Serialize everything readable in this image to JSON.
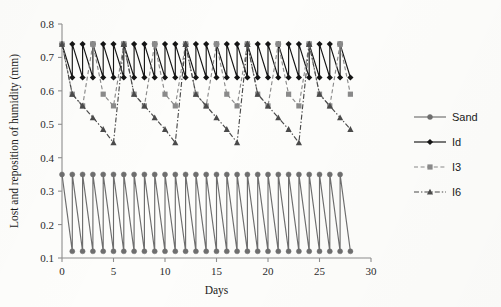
{
  "chart_data": {
    "type": "line",
    "title": "",
    "xlabel": "Days",
    "ylabel": "Lost and reposition of humidity (mm)",
    "xlim": [
      0,
      30
    ],
    "ylim": [
      0.1,
      0.8
    ],
    "xticks": [
      "0",
      "5",
      "10",
      "15",
      "20",
      "25",
      "30"
    ],
    "xtick_values": [
      0,
      5,
      10,
      15,
      20,
      25,
      30
    ],
    "yticks": [
      "0.1",
      "0.2",
      "0.3",
      "0.4",
      "0.5",
      "0.6",
      "0.7",
      "0.8"
    ],
    "ytick_values": [
      0.1,
      0.2,
      0.3,
      0.4,
      0.5,
      0.6,
      0.7,
      0.8
    ],
    "grid": false,
    "legend_position": "right",
    "series": [
      {
        "name": "Sand",
        "marker": "circle",
        "line_style": "solid",
        "color": "#6e6e6e",
        "marker_color": "#6e6e6e",
        "cycle_days": 1,
        "peak": 0.35,
        "trough": 0.12,
        "x": [
          0,
          1,
          1,
          2,
          2,
          3,
          3,
          4,
          4,
          5,
          5,
          6,
          6,
          7,
          7,
          8,
          8,
          9,
          9,
          10,
          10,
          11,
          11,
          12,
          12,
          13,
          13,
          14,
          14,
          15,
          15,
          16,
          16,
          17,
          17,
          18,
          18,
          19,
          19,
          20,
          20,
          21,
          21,
          22,
          22,
          23,
          23,
          24,
          24,
          25,
          25,
          26,
          26,
          27,
          27,
          28
        ],
        "y": [
          0.35,
          0.12,
          0.35,
          0.12,
          0.35,
          0.12,
          0.35,
          0.12,
          0.35,
          0.12,
          0.35,
          0.12,
          0.35,
          0.12,
          0.35,
          0.12,
          0.35,
          0.12,
          0.35,
          0.12,
          0.35,
          0.12,
          0.35,
          0.12,
          0.35,
          0.12,
          0.35,
          0.12,
          0.35,
          0.12,
          0.35,
          0.12,
          0.35,
          0.12,
          0.35,
          0.12,
          0.35,
          0.12,
          0.35,
          0.12,
          0.35,
          0.12,
          0.35,
          0.12,
          0.35,
          0.12,
          0.35,
          0.12,
          0.35,
          0.12,
          0.35,
          0.12,
          0.35,
          0.12,
          0.35,
          0.12
        ]
      },
      {
        "name": "Id",
        "marker": "diamond",
        "line_style": "solid",
        "color": "#151515",
        "marker_color": "#151515",
        "cycle_days": 1,
        "peak": 0.74,
        "trough": 0.64,
        "x": [
          0,
          1,
          1,
          2,
          2,
          3,
          3,
          4,
          4,
          5,
          5,
          6,
          6,
          7,
          7,
          8,
          8,
          9,
          9,
          10,
          10,
          11,
          11,
          12,
          12,
          13,
          13,
          14,
          14,
          15,
          15,
          16,
          16,
          17,
          17,
          18,
          18,
          19,
          19,
          20,
          20,
          21,
          21,
          22,
          22,
          23,
          23,
          24,
          24,
          25,
          25,
          26,
          26,
          27,
          27,
          28
        ],
        "y": [
          0.74,
          0.64,
          0.74,
          0.64,
          0.74,
          0.64,
          0.74,
          0.64,
          0.74,
          0.64,
          0.74,
          0.64,
          0.74,
          0.64,
          0.74,
          0.64,
          0.74,
          0.64,
          0.74,
          0.64,
          0.74,
          0.64,
          0.74,
          0.64,
          0.74,
          0.64,
          0.74,
          0.64,
          0.74,
          0.64,
          0.74,
          0.64,
          0.74,
          0.64,
          0.74,
          0.64,
          0.74,
          0.64,
          0.74,
          0.64,
          0.74,
          0.64,
          0.74,
          0.64,
          0.74,
          0.64,
          0.74,
          0.64,
          0.74,
          0.64,
          0.74,
          0.64,
          0.74,
          0.64,
          0.74,
          0.64
        ]
      },
      {
        "name": "I3",
        "marker": "square",
        "line_style": "dashed",
        "color": "#8a8a8a",
        "marker_color": "#8a8a8a",
        "cycle_days": 3,
        "cycle_values": [
          0.74,
          0.59,
          0.555
        ],
        "x": [
          0,
          1,
          2,
          3,
          3,
          4,
          5,
          6,
          6,
          7,
          8,
          9,
          9,
          10,
          11,
          12,
          12,
          13,
          14,
          15,
          15,
          16,
          17,
          18,
          18,
          19,
          20,
          21,
          21,
          22,
          23,
          24,
          24,
          25,
          26,
          27,
          27,
          28
        ],
        "y": [
          0.74,
          0.59,
          0.555,
          0.74,
          0.74,
          0.59,
          0.555,
          0.74,
          0.74,
          0.59,
          0.555,
          0.74,
          0.74,
          0.59,
          0.555,
          0.74,
          0.74,
          0.59,
          0.555,
          0.74,
          0.74,
          0.59,
          0.555,
          0.74,
          0.74,
          0.59,
          0.555,
          0.74,
          0.74,
          0.59,
          0.555,
          0.74,
          0.74,
          0.59,
          0.555,
          0.74,
          0.74,
          0.59
        ]
      },
      {
        "name": "I6",
        "marker": "triangle",
        "line_style": "dashdot",
        "color": "#4a4a4a",
        "marker_color": "#4a4a4a",
        "cycle_days": 6,
        "cycle_values": [
          0.74,
          0.59,
          0.555,
          0.52,
          0.485,
          0.445
        ],
        "x": [
          0,
          1,
          2,
          3,
          4,
          5,
          6,
          6,
          7,
          8,
          9,
          10,
          11,
          12,
          12,
          13,
          14,
          15,
          16,
          17,
          18,
          18,
          19,
          20,
          21,
          22,
          23,
          24,
          24,
          25,
          26,
          27,
          28
        ],
        "y": [
          0.74,
          0.59,
          0.555,
          0.52,
          0.485,
          0.445,
          0.74,
          0.74,
          0.59,
          0.555,
          0.52,
          0.485,
          0.445,
          0.74,
          0.74,
          0.59,
          0.555,
          0.52,
          0.485,
          0.445,
          0.74,
          0.74,
          0.59,
          0.555,
          0.52,
          0.485,
          0.445,
          0.74,
          0.74,
          0.59,
          0.555,
          0.52,
          0.485
        ]
      }
    ]
  },
  "legend": {
    "entries": [
      {
        "label": "Sand"
      },
      {
        "label": "Id"
      },
      {
        "label": "I3"
      },
      {
        "label": "I6"
      }
    ]
  }
}
